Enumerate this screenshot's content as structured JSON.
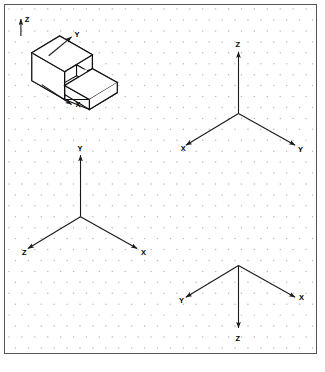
{
  "sheet": {
    "width": 325,
    "height": 372,
    "background_color": "#ffffff",
    "frame_border_color": "#555555",
    "grid": {
      "type": "isometric-dot-grid",
      "dot_color": "#b9b9c4",
      "spacing_x": 13,
      "spacing_y": 11
    }
  },
  "figures": [
    {
      "id": "isometric-object",
      "name": "isometric-solid-block",
      "description": "Isometric pictorial of an L/step block with a notch",
      "axes": [
        {
          "label": "Z",
          "direction": "up",
          "label_x": 23,
          "label_y": 18
        },
        {
          "label": "Y",
          "direction": "upper-right",
          "label_x": 64,
          "label_y": 36
        },
        {
          "label": "X",
          "direction": "lower-right",
          "label_x": 75,
          "label_y": 105
        }
      ]
    },
    {
      "id": "triad-top-right",
      "name": "axis-triad-top-right",
      "origin_x": 243,
      "origin_y": 113,
      "axes": [
        {
          "label": "Z",
          "direction": "up",
          "label_x": 240,
          "label_y": 48
        },
        {
          "label": "X",
          "direction": "lower-left",
          "label_x": 187,
          "label_y": 150
        },
        {
          "label": "Y",
          "direction": "lower-right",
          "label_x": 302,
          "label_y": 150
        }
      ]
    },
    {
      "id": "triad-center-left",
      "name": "axis-triad-center-left",
      "origin_x": 84,
      "origin_y": 218,
      "axes": [
        {
          "label": "Y",
          "direction": "up",
          "label_x": 81,
          "label_y": 152
        },
        {
          "label": "Z",
          "direction": "lower-left",
          "label_x": 24,
          "label_y": 253
        },
        {
          "label": "X",
          "direction": "lower-right",
          "label_x": 146,
          "label_y": 248
        }
      ]
    },
    {
      "id": "triad-bottom-right",
      "name": "axis-triad-bottom-right",
      "origin_x": 243,
      "origin_y": 268,
      "axes": [
        {
          "label": "Z",
          "direction": "down",
          "label_x": 241,
          "label_y": 343
        },
        {
          "label": "Y",
          "direction": "upper-left",
          "label_x": 184,
          "label_y": 302
        },
        {
          "label": "X",
          "direction": "upper-right",
          "label_x": 304,
          "label_y": 300
        }
      ]
    }
  ],
  "labels": {
    "x": "X",
    "y": "Y",
    "z": "Z"
  },
  "colors": {
    "line": "#1a1a1a",
    "edge": "#111111",
    "dot": "#b9b9c4",
    "frame": "#555555",
    "paper": "#ffffff"
  }
}
